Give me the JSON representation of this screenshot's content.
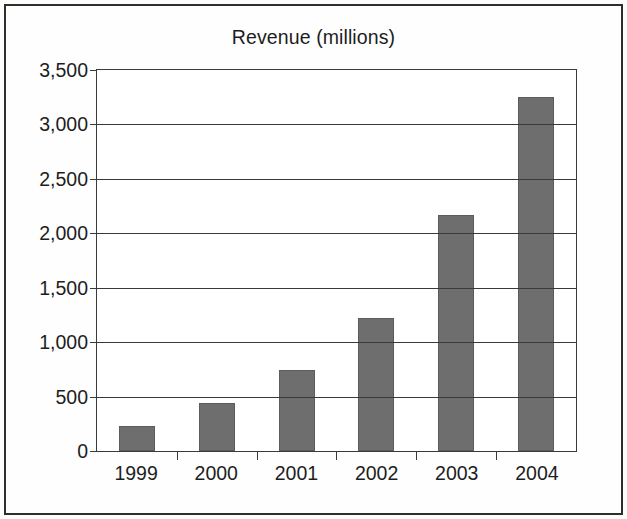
{
  "chart_data": {
    "type": "bar",
    "title": "Revenue (millions)",
    "xlabel": "",
    "ylabel": "",
    "categories": [
      "1999",
      "2000",
      "2001",
      "2002",
      "2003",
      "2004"
    ],
    "values": [
      230,
      440,
      740,
      1220,
      2170,
      3250
    ],
    "series": [
      {
        "name": "Revenue (millions)",
        "values": [
          230,
          440,
          740,
          1220,
          2170,
          3250
        ]
      }
    ],
    "ylim": [
      0,
      3500
    ],
    "ytick_values": [
      0,
      500,
      1000,
      1500,
      2000,
      2500,
      3000,
      3500
    ],
    "ytick_labels": [
      "0",
      "500",
      "1,000",
      "1,500",
      "2,000",
      "2,500",
      "3,000",
      "3,500"
    ],
    "grid": "horizontal",
    "legend": "none",
    "bar_color": "#6e6e6e",
    "axis_color": "#3a3a3a",
    "background_color": "#ffffff",
    "frame_color": "#2e2e2e"
  }
}
